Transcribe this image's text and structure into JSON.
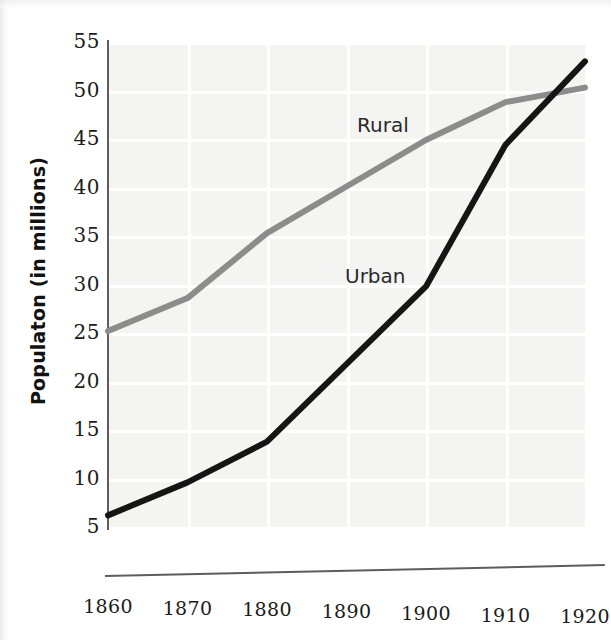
{
  "chart_data": {
    "type": "line",
    "title": "",
    "xlabel": "",
    "ylabel": "Populaton (in millions)",
    "x": [
      1860,
      1870,
      1880,
      1890,
      1900,
      1910,
      1920
    ],
    "categories": [
      "1860",
      "1870",
      "1880",
      "1890",
      "1900",
      "1910",
      "1920"
    ],
    "series": [
      {
        "name": "Rural",
        "color": "#8c8c8c",
        "values": [
          25.2,
          28.6,
          35.3,
          40.1,
          44.9,
          48.8,
          50.3
        ]
      },
      {
        "name": "Urban",
        "color": "#151515",
        "values": [
          6.2,
          9.6,
          13.8,
          21.8,
          29.8,
          44.4,
          53.0
        ]
      }
    ],
    "xlim": [
      1860,
      1920
    ],
    "ylim": [
      5,
      55
    ],
    "yticks": [
      5,
      10,
      15,
      20,
      25,
      30,
      35,
      40,
      45,
      50,
      55
    ],
    "ytick_labels": [
      "5",
      "10",
      "15",
      "20",
      "25",
      "30",
      "35",
      "40",
      "45",
      "50",
      "55"
    ],
    "xticks": [
      1860,
      1870,
      1880,
      1890,
      1900,
      1910,
      1920
    ],
    "xtick_labels": [
      "1860",
      "1870",
      "1880",
      "1890",
      "1900",
      "1910",
      "1920"
    ],
    "grid": true,
    "legend": "inline-labels",
    "annotations": [
      {
        "text": "Rural",
        "series": "Rural"
      },
      {
        "text": "Urban",
        "series": "Urban"
      }
    ]
  },
  "axes": {
    "y_title": "Populaton (in millions)"
  },
  "labels": {
    "rural": "Rural",
    "urban": "Urban"
  },
  "colors": {
    "rural_line": "#8c8c8c",
    "urban_line": "#151515",
    "axis": "#5d5d5d",
    "plot_background": "#f4f4f3",
    "text": "#1b1b1b"
  }
}
